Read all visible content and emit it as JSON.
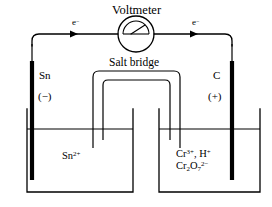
{
  "diagram": {
    "title": "Voltmeter",
    "salt_bridge_label": "Salt bridge",
    "electron_label_left": "e",
    "electron_label_right": "e",
    "electron_superscript": "−",
    "left_half_cell": {
      "electrode_label": "Sn",
      "polarity": "(−)",
      "solution_species": "Sn",
      "solution_charge": "2+"
    },
    "right_half_cell": {
      "electrode_label": "C",
      "polarity": "(+)",
      "solution_line1_a": "Cr",
      "solution_line1_a_sup": "3+",
      "solution_line1_sep": ", H",
      "solution_line1_b_sup": "+",
      "solution_line2_a": "Cr",
      "solution_line2_sub": "2",
      "solution_line2_b": "O",
      "solution_line2_sub2": "7",
      "solution_line2_sup": "2−"
    },
    "colors": {
      "ink": "#000000",
      "background": "#ffffff"
    }
  }
}
